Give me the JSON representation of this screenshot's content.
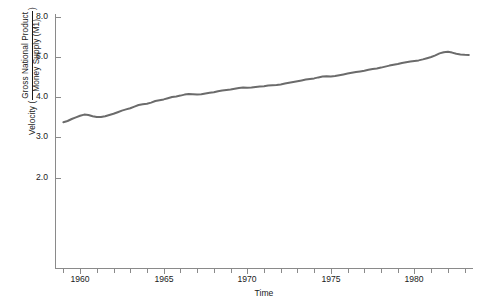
{
  "chart_data": {
    "type": "line",
    "title": "",
    "xlabel": "Time",
    "ylabel_parts": {
      "prefix": "Velocity (",
      "numerator": "Gross National Product",
      "denominator": "Money Supply (M1)",
      "suffix": ")"
    },
    "ylabel": "Velocity ( Gross National Product / Money Supply (M1) )",
    "grid": false,
    "legend": null,
    "xlim": [
      1958.5,
      1983.5
    ],
    "ylim": [
      1.6,
      8.3
    ],
    "xtick_labels": [
      "1960",
      "1965",
      "1970",
      "1975",
      "1980"
    ],
    "xtick_values": [
      1960,
      1965,
      1970,
      1975,
      1980
    ],
    "xminor_values": [
      1959,
      1961,
      1962,
      1963,
      1964,
      1966,
      1967,
      1968,
      1969,
      1971,
      1972,
      1973,
      1974,
      1976,
      1977,
      1978,
      1979,
      1981,
      1982,
      1983
    ],
    "ytick_labels": [
      "8.0",
      "6.0",
      "4.0",
      "3.0",
      "2.0"
    ],
    "ytick_values": [
      8.0,
      6.0,
      4.0,
      3.0,
      2.0
    ],
    "ytick_pixels": [
      17,
      57,
      97,
      137,
      178
    ],
    "line_color": "#6b6b6b",
    "line_width": 2.0,
    "series": [
      {
        "name": "GNP / M1 velocity",
        "x": [
          1959.0,
          1959.25,
          1959.5,
          1959.75,
          1960.0,
          1960.25,
          1960.5,
          1960.75,
          1961.0,
          1961.25,
          1961.5,
          1961.75,
          1962.0,
          1962.25,
          1962.5,
          1962.75,
          1963.0,
          1963.25,
          1963.5,
          1963.75,
          1964.0,
          1964.25,
          1964.5,
          1964.75,
          1965.0,
          1965.25,
          1965.5,
          1965.75,
          1966.0,
          1966.25,
          1966.5,
          1966.75,
          1967.0,
          1967.25,
          1967.5,
          1967.75,
          1968.0,
          1968.25,
          1968.5,
          1968.75,
          1969.0,
          1969.25,
          1969.5,
          1969.75,
          1970.0,
          1970.25,
          1970.5,
          1970.75,
          1971.0,
          1971.25,
          1971.5,
          1971.75,
          1972.0,
          1972.25,
          1972.5,
          1972.75,
          1973.0,
          1973.25,
          1973.5,
          1973.75,
          1974.0,
          1974.25,
          1974.5,
          1974.75,
          1975.0,
          1975.25,
          1975.5,
          1975.75,
          1976.0,
          1976.25,
          1976.5,
          1976.75,
          1977.0,
          1977.25,
          1977.5,
          1977.75,
          1978.0,
          1978.25,
          1978.5,
          1978.75,
          1979.0,
          1979.25,
          1979.5,
          1979.75,
          1980.0,
          1980.25,
          1980.5,
          1980.75,
          1981.0,
          1981.25,
          1981.5,
          1981.75,
          1982.0,
          1982.25,
          1982.5,
          1982.75,
          1983.0,
          1983.25
        ],
        "y": [
          3.37,
          3.4,
          3.45,
          3.49,
          3.53,
          3.56,
          3.55,
          3.52,
          3.5,
          3.5,
          3.52,
          3.55,
          3.58,
          3.62,
          3.66,
          3.69,
          3.72,
          3.76,
          3.8,
          3.82,
          3.83,
          3.86,
          3.9,
          3.92,
          3.94,
          3.97,
          4.0,
          4.03,
          4.07,
          4.12,
          4.15,
          4.14,
          4.12,
          4.14,
          4.18,
          4.21,
          4.24,
          4.29,
          4.33,
          4.35,
          4.37,
          4.41,
          4.45,
          4.47,
          4.46,
          4.47,
          4.5,
          4.52,
          4.54,
          4.57,
          4.59,
          4.6,
          4.63,
          4.67,
          4.71,
          4.75,
          4.79,
          4.83,
          4.87,
          4.9,
          4.93,
          4.98,
          5.02,
          5.04,
          5.03,
          5.05,
          5.09,
          5.13,
          5.17,
          5.21,
          5.25,
          5.28,
          5.31,
          5.36,
          5.4,
          5.43,
          5.47,
          5.52,
          5.57,
          5.61,
          5.65,
          5.7,
          5.74,
          5.77,
          5.8,
          5.83,
          5.88,
          5.94,
          6.0,
          6.08,
          6.18,
          6.24,
          6.26,
          6.22,
          6.16,
          6.13,
          6.11,
          6.1
        ]
      }
    ],
    "annotations": []
  },
  "caption": ""
}
